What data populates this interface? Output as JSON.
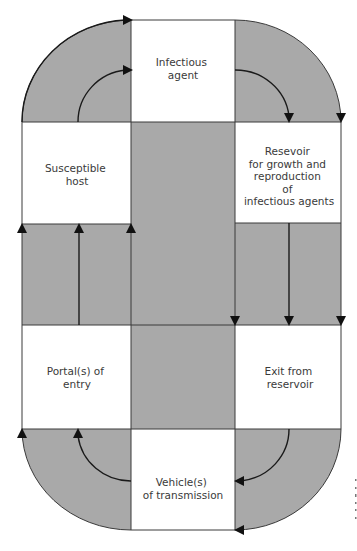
{
  "diagram": {
    "type": "cycle",
    "colors": {
      "band": "#a9a9a9",
      "box": "#ffffff",
      "stroke": "#3a3a3a",
      "arrow": "#111111",
      "text": "#3a3a3a"
    },
    "nodes": [
      {
        "id": "infectious-agent",
        "lines": [
          "Infectious",
          "agent"
        ]
      },
      {
        "id": "reservoir",
        "lines": [
          "Resevoir",
          "for growth and",
          "reproduction",
          "of",
          "infectious agents"
        ]
      },
      {
        "id": "exit",
        "lines": [
          "Exit from",
          "reservoir"
        ]
      },
      {
        "id": "vehicle",
        "lines": [
          "Vehicle(s)",
          "of transmission"
        ]
      },
      {
        "id": "portal",
        "lines": [
          "Portal(s) of",
          "entry"
        ]
      },
      {
        "id": "host",
        "lines": [
          "Susceptible",
          "host"
        ]
      }
    ],
    "edges": [
      {
        "from": "infectious-agent",
        "to": "reservoir"
      },
      {
        "from": "reservoir",
        "to": "exit"
      },
      {
        "from": "exit",
        "to": "vehicle"
      },
      {
        "from": "vehicle",
        "to": "portal"
      },
      {
        "from": "portal",
        "to": "host"
      },
      {
        "from": "host",
        "to": "infectious-agent"
      }
    ]
  }
}
